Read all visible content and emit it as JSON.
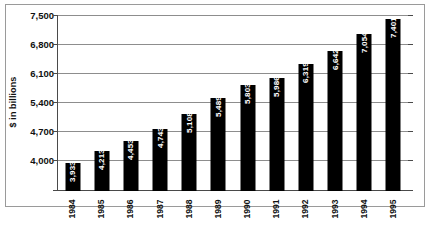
{
  "chart_data": {
    "type": "bar",
    "title": "",
    "subtitle": "",
    "xlabel": "",
    "ylabel": "$ in billions",
    "ylim": [
      4000,
      7500
    ],
    "ytick_values": [
      4000,
      4700,
      5400,
      6100,
      6800,
      7500
    ],
    "ytick_labels": [
      "4,000",
      "4,700",
      "5,400",
      "6,100",
      "6,800",
      "7,500"
    ],
    "grid": true,
    "legend": "none",
    "orientation": "vertical",
    "bar_color": "#000000",
    "value_label_color": "#ffffff",
    "categories": [
      "1984",
      "1985",
      "1986",
      "1987",
      "1988",
      "1989",
      "1990",
      "1991",
      "1992",
      "1993",
      "1994",
      "1995"
    ],
    "values": [
      3933,
      4213,
      4453,
      4743,
      5108,
      5489,
      5803,
      5986,
      6319,
      6642,
      7054,
      7401
    ],
    "value_labels": [
      "3,933",
      "4,213",
      "4,453",
      "4,743",
      "5,108",
      "5,489",
      "5,803",
      "5,986",
      "6,319",
      "6,642",
      "7,054",
      "7,401"
    ]
  }
}
